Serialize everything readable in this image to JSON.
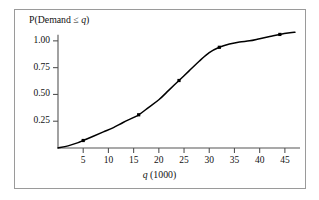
{
  "figure": {
    "background_color": "#ffffff",
    "frame_color": "#9a9a9a",
    "axis_color": "#555555",
    "curve_color": "#000000",
    "marker_color": "#000000"
  },
  "labels": {
    "ylabel_prefix": "P(Demand ≤ ",
    "ylabel_var": "q",
    "ylabel_suffix": ")",
    "xlabel_var": "q",
    "xlabel_suffix": " (1000)"
  },
  "chart_data": {
    "type": "line",
    "title": "",
    "subtitle": "",
    "xlabel": "q (1000)",
    "ylabel": "P(Demand ≤ q)",
    "xlim": [
      0,
      48
    ],
    "ylim": [
      0,
      1.12
    ],
    "grid": false,
    "legend": "none",
    "xticks": [
      5,
      10,
      15,
      20,
      25,
      30,
      35,
      40,
      45
    ],
    "xtick_labels": [
      "5",
      "10",
      "15",
      "20",
      "25",
      "30",
      "35",
      "40",
      "45"
    ],
    "yticks": [
      0.25,
      0.5,
      0.75,
      1.0
    ],
    "ytick_labels": [
      "0.25",
      "0.50",
      "0.75",
      "1.00"
    ],
    "series": [
      {
        "name": "Cumulative demand distribution",
        "kind": "curve",
        "x": [
          0,
          2,
          4,
          5,
          7,
          9,
          11,
          13,
          16,
          18,
          20,
          22,
          24,
          26,
          28,
          30,
          32,
          34,
          36,
          38,
          40,
          42,
          44,
          46,
          47
        ],
        "y": [
          0.0,
          0.02,
          0.05,
          0.07,
          0.11,
          0.15,
          0.19,
          0.24,
          0.31,
          0.38,
          0.45,
          0.54,
          0.63,
          0.72,
          0.81,
          0.89,
          0.94,
          0.97,
          0.99,
          1.0,
          1.02,
          1.04,
          1.06,
          1.075,
          1.08
        ]
      },
      {
        "name": "Plotted data points",
        "kind": "markers",
        "marker": "square",
        "x": [
          5,
          16,
          24,
          32,
          44
        ],
        "y": [
          0.07,
          0.31,
          0.63,
          0.94,
          1.06
        ]
      }
    ]
  }
}
